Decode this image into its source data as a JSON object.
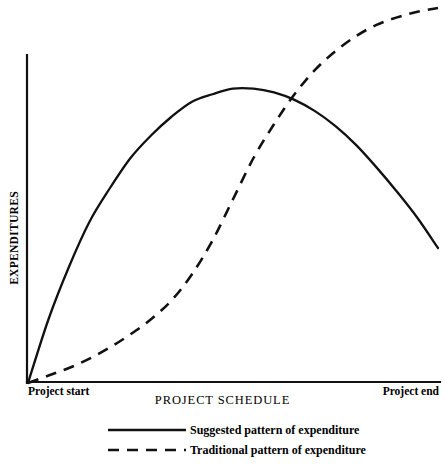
{
  "chart_data": {
    "type": "line",
    "title": "",
    "xlabel": "PROJECT SCHEDULE",
    "ylabel": "EXPENDITURES",
    "xticklabels": [
      "Project start",
      "Project end"
    ],
    "yticklabels": [],
    "xlim": [
      0,
      100
    ],
    "ylim": [
      0,
      100
    ],
    "grid": false,
    "legend_position": "below-axes",
    "annotations": [],
    "series": [
      {
        "name": "Suggested pattern of expenditure",
        "style": "solid",
        "color": "#111111",
        "x": [
          0,
          5,
          10,
          15,
          20,
          25,
          30,
          35,
          40,
          45,
          50,
          55,
          60,
          65,
          70,
          75,
          80,
          85,
          90,
          95,
          100
        ],
        "y": [
          0,
          17,
          31,
          43,
          52,
          60,
          66,
          71,
          75,
          77,
          78.5,
          78.5,
          77.5,
          75.5,
          72.5,
          68.5,
          63.5,
          57.5,
          51,
          44,
          36
        ]
      },
      {
        "name": "Traditional pattern of expenditure",
        "style": "dashed",
        "color": "#111111",
        "x": [
          0,
          5,
          10,
          15,
          20,
          25,
          30,
          35,
          40,
          45,
          50,
          55,
          60,
          65,
          70,
          75,
          80,
          85,
          90,
          95,
          100
        ],
        "y": [
          0,
          2,
          4,
          6.5,
          9.5,
          13,
          17,
          22,
          29,
          38,
          49,
          60,
          69,
          77,
          83.5,
          88.5,
          92.5,
          95.5,
          97.5,
          99,
          100
        ]
      }
    ]
  },
  "axes": {
    "y_axis_label": "EXPENDITURES",
    "x_axis_label": "PROJECT SCHEDULE",
    "x_start_tick": "Project start",
    "x_end_tick": "Project end"
  },
  "legend": {
    "items": [
      {
        "label": "Suggested pattern of expenditure",
        "style": "solid"
      },
      {
        "label": "Traditional pattern of expenditure",
        "style": "dashed"
      }
    ]
  },
  "colors": {
    "ink": "#111111",
    "background": "#ffffff"
  }
}
